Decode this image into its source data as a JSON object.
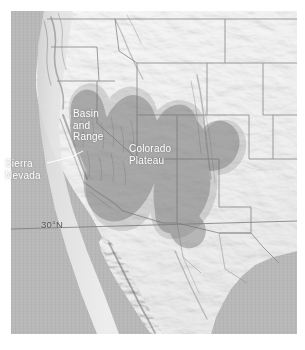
{
  "figure": {
    "kind": "shaded-relief-map",
    "region": "Western United States and northwestern Mexico",
    "width": 305,
    "height": 350
  },
  "map": {
    "frame": {
      "left": 11,
      "top": 11,
      "width": 286,
      "height": 323
    },
    "basemap": "grayscale shaded relief",
    "ocean_color": "#b8b8b8",
    "land_color": "#f2f2f2",
    "boundary_color": "#8c8c8c",
    "overlay_color": "#8f8f8f",
    "label_color": "#ffffff",
    "graticule_color": "#7a7a7a"
  },
  "labels": {
    "basin_and_range": "Basin\nand\nRange",
    "colorado_plateau": "Colorado\nPlateau",
    "sierra_nevada": "Sierra\nNevada",
    "latitude_30n": "30°N"
  },
  "annotations": {
    "shaded_provinces": [
      "Basin and Range",
      "Colorado Plateau"
    ],
    "leader_lines": [
      "sierra-nevada-leader"
    ],
    "graticules": [
      "30°N"
    ]
  }
}
